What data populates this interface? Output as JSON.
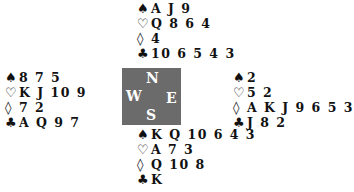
{
  "suit_symbols": {
    "spades": "♠",
    "hearts": "♡",
    "diamonds": "◊",
    "clubs": "♣"
  },
  "compass": {
    "north": "N",
    "west": "W",
    "east": "E",
    "south": "S"
  },
  "hands": {
    "north": {
      "spades": "A J 9",
      "hearts": "Q 8 6 4",
      "diamonds": "4",
      "clubs": "10 6 5 4 3"
    },
    "west": {
      "spades": "8 7 5",
      "hearts": "K J 10 9",
      "diamonds": "7 2",
      "clubs": "A Q 9 7"
    },
    "east": {
      "spades": "2",
      "hearts": "5 2",
      "diamonds": "A K J 9 6 5 3",
      "clubs": "J 8 2"
    },
    "south": {
      "spades": "K Q 10 6 4 3",
      "hearts": "A 7 3",
      "diamonds": "Q 10 8",
      "clubs": "K"
    }
  }
}
